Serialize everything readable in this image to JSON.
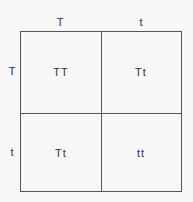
{
  "punnett_square": {
    "column_alleles": [
      "T",
      "t"
    ],
    "row_alleles": [
      "T",
      "t"
    ],
    "cells": [
      [
        "TT",
        "Tt"
      ],
      [
        "Tt",
        "tt"
      ]
    ]
  }
}
